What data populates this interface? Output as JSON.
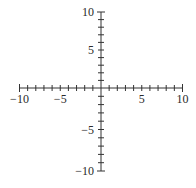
{
  "chart_data": {
    "type": "scatter",
    "title": "",
    "subtitle": "",
    "xlabel": "",
    "ylabel": "",
    "xlim": [
      -10,
      10
    ],
    "ylim": [
      -10,
      10
    ],
    "grid": false,
    "legend": null,
    "x_tick_step": 1,
    "y_tick_step": 1,
    "x_tick_labels": [
      "-10",
      "-5",
      "5",
      "10"
    ],
    "x_tick_label_values": [
      -10,
      -5,
      5,
      10
    ],
    "y_tick_labels": [
      "10",
      "5",
      "-5",
      "-10"
    ],
    "y_tick_label_values": [
      10,
      5,
      -5,
      -10
    ],
    "series": []
  },
  "style": {
    "axis_color": "#333333",
    "label_color": "#2a2a2a",
    "background": "#ffffff"
  },
  "layout": {
    "origin_px": [
      101,
      88
    ],
    "x_min_px": 19,
    "x_max_px": 182,
    "y_top_px": 12,
    "y_bottom_px": 171
  }
}
